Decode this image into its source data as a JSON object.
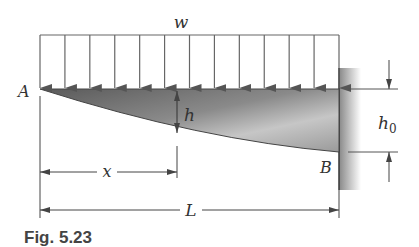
{
  "figure": {
    "caption": "Fig. 5.23",
    "labels": {
      "load": "w",
      "point_a": "A",
      "point_b": "B",
      "depth": "h",
      "depth_fixed": "h",
      "depth_fixed_sub": "0",
      "position": "x",
      "length": "L"
    },
    "load_arrow_count": 13,
    "colors": {
      "line": "#555555",
      "beam_dark": "#6e6e6e",
      "beam_light": "#c8c8c8",
      "wall": "#9a9a9a"
    }
  }
}
